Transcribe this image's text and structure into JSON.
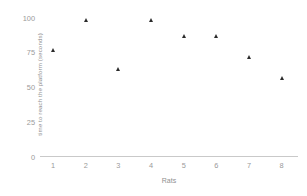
{
  "chart_data": {
    "type": "scatter",
    "title": "",
    "xlabel": "Rats",
    "ylabel": "time to reach the platform (seconds)",
    "x": [
      1,
      2,
      3,
      4,
      5,
      6,
      7,
      8
    ],
    "categories": [
      "1",
      "2",
      "3",
      "4",
      "5",
      "6",
      "7",
      "8"
    ],
    "values": [
      77,
      98,
      63,
      98,
      87,
      87,
      72,
      57
    ],
    "series": [
      {
        "name": "time to reach the platform",
        "values": [
          77,
          98,
          63,
          98,
          87,
          87,
          72,
          57
        ]
      }
    ],
    "xlim": [
      0.6,
      8.5
    ],
    "ylim": [
      0,
      104
    ],
    "yticks": [
      0,
      25,
      50,
      75,
      100
    ],
    "ytick_labels": [
      "0",
      "25",
      "50",
      "75",
      "100"
    ],
    "xticks": [
      1,
      2,
      3,
      4,
      5,
      6,
      7,
      8
    ],
    "xtick_labels": [
      "1",
      "2",
      "3",
      "4",
      "5",
      "6",
      "7",
      "8"
    ],
    "grid": false,
    "legend": false,
    "marker": "triangle",
    "marker_color": "#2b2b2b",
    "axis_color": "#c9c9c9",
    "text_color": "#9a9a9a"
  }
}
